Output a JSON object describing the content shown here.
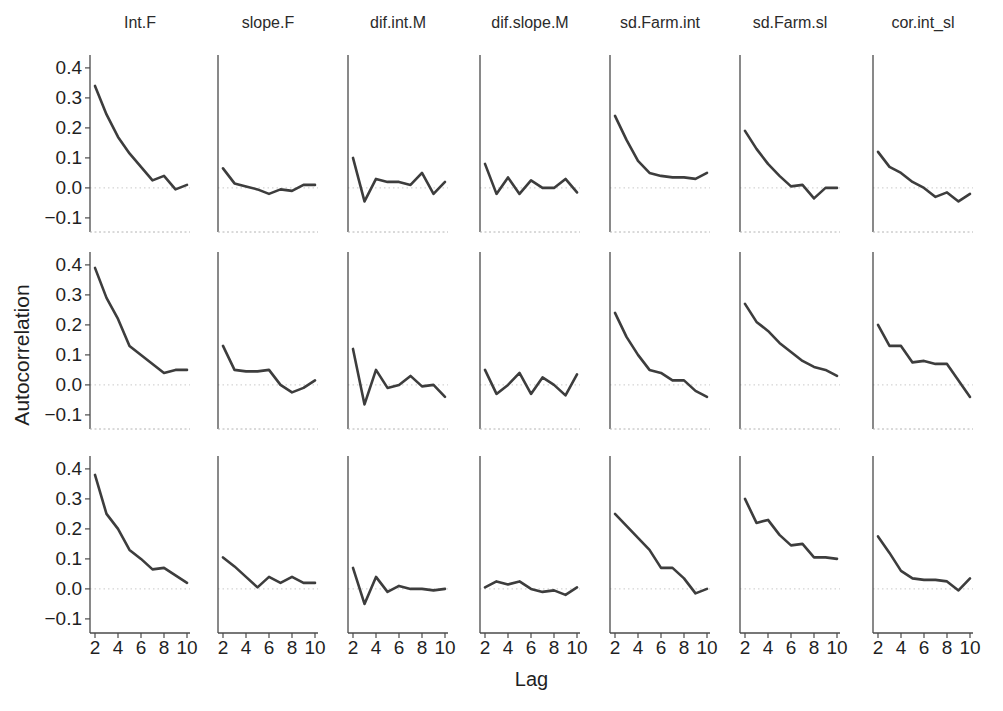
{
  "chart_data": {
    "type": "line",
    "title": "",
    "xlabel": "Lag",
    "ylabel": "Autocorrelation",
    "x": [
      2,
      3,
      4,
      5,
      6,
      7,
      8,
      9,
      10
    ],
    "xlim": [
      2,
      10
    ],
    "ylim": [
      -0.15,
      0.44
    ],
    "xticks": [
      2,
      4,
      6,
      8,
      10
    ],
    "xtick_labels": [
      "2",
      "4",
      "6",
      "8",
      "10"
    ],
    "yticks": [
      0.4,
      0.3,
      0.2,
      0.1,
      0.0,
      -0.1
    ],
    "ytick_labels": [
      "0.4",
      "0.3",
      "0.2",
      "0.1",
      "0.0",
      "−0.1"
    ],
    "grid": "dotted zero reference line in each panel; y tick labels only on left column; x tick labels only on bottom row",
    "legend": "none",
    "n_rows": 3,
    "columns": [
      "Int.F",
      "slope.F",
      "dif.int.M",
      "dif.slope.M",
      "sd.Farm.int",
      "sd.Farm.sl",
      "cor.int_sl"
    ],
    "line_color": "#3d3d3d",
    "zero_line_color": "#c9c9c9",
    "axis_color": "#4a4a4a",
    "panels": [
      {
        "row": 0,
        "param": "Int.F",
        "values": [
          0.34,
          0.245,
          0.17,
          0.115,
          0.07,
          0.025,
          0.04,
          -0.005,
          0.01
        ]
      },
      {
        "row": 0,
        "param": "slope.F",
        "values": [
          0.065,
          0.015,
          0.005,
          -0.005,
          -0.02,
          -0.005,
          -0.01,
          0.01,
          0.01
        ]
      },
      {
        "row": 0,
        "param": "dif.int.M",
        "values": [
          0.1,
          -0.045,
          0.03,
          0.02,
          0.02,
          0.01,
          0.05,
          -0.02,
          0.02
        ]
      },
      {
        "row": 0,
        "param": "dif.slope.M",
        "values": [
          0.08,
          -0.02,
          0.035,
          -0.02,
          0.025,
          0.0,
          0.0,
          0.03,
          -0.015
        ]
      },
      {
        "row": 0,
        "param": "sd.Farm.int",
        "values": [
          0.24,
          0.16,
          0.09,
          0.05,
          0.04,
          0.035,
          0.035,
          0.03,
          0.05
        ]
      },
      {
        "row": 0,
        "param": "sd.Farm.sl",
        "values": [
          0.19,
          0.13,
          0.08,
          0.04,
          0.005,
          0.01,
          -0.035,
          0.0,
          0.0
        ]
      },
      {
        "row": 0,
        "param": "cor.int_sl",
        "values": [
          0.12,
          0.07,
          0.05,
          0.02,
          0.0,
          -0.03,
          -0.015,
          -0.045,
          -0.02
        ]
      },
      {
        "row": 1,
        "param": "Int.F",
        "values": [
          0.39,
          0.29,
          0.22,
          0.13,
          0.1,
          0.07,
          0.04,
          0.05,
          0.05
        ]
      },
      {
        "row": 1,
        "param": "slope.F",
        "values": [
          0.13,
          0.05,
          0.045,
          0.045,
          0.05,
          0.0,
          -0.025,
          -0.01,
          0.015
        ]
      },
      {
        "row": 1,
        "param": "dif.int.M",
        "values": [
          0.12,
          -0.065,
          0.05,
          -0.01,
          0.0,
          0.03,
          -0.005,
          0.0,
          -0.04
        ]
      },
      {
        "row": 1,
        "param": "dif.slope.M",
        "values": [
          0.05,
          -0.03,
          0.0,
          0.04,
          -0.03,
          0.025,
          0.0,
          -0.035,
          0.035
        ]
      },
      {
        "row": 1,
        "param": "sd.Farm.int",
        "values": [
          0.24,
          0.16,
          0.1,
          0.05,
          0.04,
          0.015,
          0.015,
          -0.02,
          -0.04
        ]
      },
      {
        "row": 1,
        "param": "sd.Farm.sl",
        "values": [
          0.27,
          0.21,
          0.18,
          0.14,
          0.11,
          0.08,
          0.06,
          0.05,
          0.03
        ]
      },
      {
        "row": 1,
        "param": "cor.int_sl",
        "values": [
          0.2,
          0.13,
          0.13,
          0.075,
          0.08,
          0.07,
          0.07,
          0.015,
          -0.04
        ]
      },
      {
        "row": 2,
        "param": "Int.F",
        "values": [
          0.38,
          0.25,
          0.2,
          0.13,
          0.1,
          0.065,
          0.07,
          0.045,
          0.02
        ]
      },
      {
        "row": 2,
        "param": "slope.F",
        "values": [
          0.105,
          0.075,
          0.04,
          0.005,
          0.04,
          0.02,
          0.04,
          0.02,
          0.02
        ]
      },
      {
        "row": 2,
        "param": "dif.int.M",
        "values": [
          0.07,
          -0.05,
          0.04,
          -0.01,
          0.01,
          0.0,
          0.0,
          -0.005,
          0.0
        ]
      },
      {
        "row": 2,
        "param": "dif.slope.M",
        "values": [
          0.005,
          0.025,
          0.015,
          0.025,
          0.0,
          -0.01,
          -0.005,
          -0.02,
          0.005
        ]
      },
      {
        "row": 2,
        "param": "sd.Farm.int",
        "values": [
          0.25,
          0.21,
          0.17,
          0.13,
          0.07,
          0.07,
          0.035,
          -0.015,
          0.0
        ]
      },
      {
        "row": 2,
        "param": "sd.Farm.sl",
        "values": [
          0.3,
          0.22,
          0.23,
          0.18,
          0.145,
          0.15,
          0.105,
          0.105,
          0.1
        ]
      },
      {
        "row": 2,
        "param": "cor.int_sl",
        "values": [
          0.175,
          0.12,
          0.06,
          0.035,
          0.03,
          0.03,
          0.025,
          -0.005,
          0.035
        ]
      }
    ]
  }
}
